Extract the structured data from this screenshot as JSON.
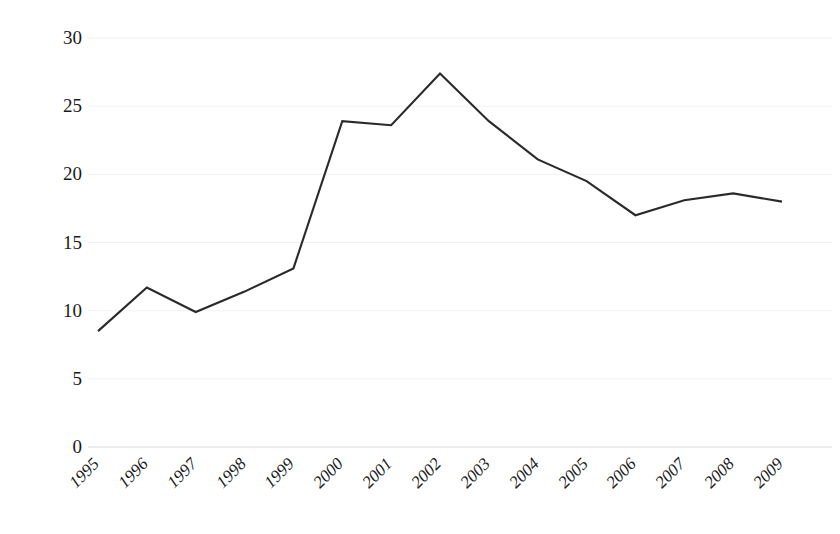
{
  "chart_data": {
    "type": "line",
    "title": "",
    "subtitle": "",
    "xlabel": "",
    "ylabel": "",
    "categories": [
      "1995",
      "1996",
      "1997",
      "1998",
      "1999",
      "2000",
      "2001",
      "2002",
      "2003",
      "2004",
      "2005",
      "2006",
      "2007",
      "2008",
      "2009"
    ],
    "values": [
      8.5,
      11.7,
      9.9,
      11.4,
      13.1,
      23.9,
      23.6,
      27.4,
      23.9,
      21.1,
      19.5,
      17.0,
      18.1,
      18.6,
      18.0
    ],
    "series": [
      {
        "name": "",
        "values": [
          8.5,
          11.7,
          9.9,
          11.4,
          13.1,
          23.9,
          23.6,
          27.4,
          23.9,
          21.1,
          19.5,
          17.0,
          18.1,
          18.6,
          18.0
        ]
      }
    ],
    "ylim": [
      0,
      30
    ],
    "yticks": [
      0,
      5,
      10,
      15,
      20,
      25,
      30
    ],
    "ytick_labels": [
      "0",
      "5",
      "10",
      "15",
      "20",
      "25",
      "30"
    ],
    "xtick_labels": [
      "1995",
      "1996",
      "1997",
      "1998",
      "1999",
      "2000",
      "2001",
      "2002",
      "2003",
      "2004",
      "2005",
      "2006",
      "2007",
      "2008",
      "2009"
    ],
    "xtick_rotation": -45,
    "grid": true,
    "grid_color": "#f2f2f2",
    "legend": false,
    "legend_position": "none",
    "line_color": "#2a2a2a",
    "line_width": 2.1,
    "markers": false,
    "background_color": "#ffffff",
    "annotations": []
  },
  "layout": {
    "plot_left": 98,
    "plot_right": 782,
    "plot_top": 38,
    "plot_bottom": 447
  }
}
